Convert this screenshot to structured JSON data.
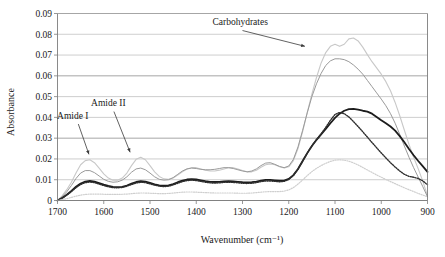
{
  "chart_data": {
    "type": "line",
    "title": "",
    "xlabel": "Wavenumber (cm⁻¹)",
    "ylabel": "Absorbance",
    "xlim": [
      1700,
      900
    ],
    "ylim": [
      0,
      0.09
    ],
    "x_reversed": true,
    "grid": true,
    "legend": "none",
    "xticks": [
      1700,
      1600,
      1500,
      1400,
      1300,
      1200,
      1100,
      1000,
      900
    ],
    "xtick_labels": [
      "1700",
      "1600",
      "1500",
      "1400",
      "1300",
      "1200",
      "1100",
      "1000",
      "900"
    ],
    "yticks": [
      0,
      0.01,
      0.02,
      0.03,
      0.04,
      0.05,
      0.06,
      0.07,
      0.08,
      0.09
    ],
    "ytick_labels": [
      "0",
      "0.01",
      "0.02",
      "0.03",
      "0.04",
      "0.05",
      "0.06",
      "0.07",
      "0.08",
      "0.09"
    ],
    "annotations": [
      {
        "text": "Amide I",
        "label_x": 1667,
        "label_y": 0.0392,
        "arrow_from_x": 1655,
        "arrow_from_y": 0.0368,
        "arrow_to_x": 1632,
        "arrow_to_y": 0.0222
      },
      {
        "text": "Amide II",
        "label_x": 1590,
        "label_y": 0.0455,
        "arrow_from_x": 1578,
        "arrow_from_y": 0.0428,
        "arrow_to_x": 1543,
        "arrow_to_y": 0.0232
      },
      {
        "text": "Carbohydrates",
        "label_x": 1305,
        "label_y": 0.0845,
        "arrow_from_x": 1300,
        "arrow_from_y": 0.0818,
        "arrow_to_x": 1165,
        "arrow_to_y": 0.0742
      }
    ],
    "x": [
      1700,
      1690,
      1680,
      1670,
      1660,
      1650,
      1640,
      1630,
      1620,
      1610,
      1600,
      1590,
      1580,
      1570,
      1560,
      1550,
      1540,
      1530,
      1520,
      1510,
      1500,
      1490,
      1480,
      1470,
      1460,
      1450,
      1440,
      1430,
      1420,
      1410,
      1400,
      1390,
      1380,
      1370,
      1360,
      1350,
      1340,
      1330,
      1320,
      1310,
      1300,
      1290,
      1280,
      1270,
      1260,
      1250,
      1240,
      1230,
      1220,
      1210,
      1200,
      1190,
      1180,
      1170,
      1160,
      1150,
      1140,
      1130,
      1120,
      1110,
      1100,
      1090,
      1080,
      1070,
      1060,
      1050,
      1040,
      1030,
      1020,
      1010,
      1000,
      990,
      980,
      970,
      960,
      950,
      940,
      930,
      920,
      910,
      900
    ],
    "series": [
      {
        "name": "spectrum-light-gray",
        "color": "#c8c8c8",
        "style": "solid",
        "width": 1.1,
        "values": [
          0.0,
          0.0022,
          0.0052,
          0.0088,
          0.0132,
          0.0172,
          0.0192,
          0.0196,
          0.0182,
          0.0156,
          0.0128,
          0.0108,
          0.0098,
          0.0098,
          0.0108,
          0.0132,
          0.0168,
          0.0198,
          0.0208,
          0.0196,
          0.0168,
          0.0138,
          0.0116,
          0.0104,
          0.0102,
          0.0108,
          0.0122,
          0.0138,
          0.0152,
          0.0158,
          0.0158,
          0.0152,
          0.0146,
          0.0142,
          0.0142,
          0.0146,
          0.0152,
          0.0158,
          0.0158,
          0.0152,
          0.0144,
          0.0138,
          0.0138,
          0.0146,
          0.016,
          0.0172,
          0.0176,
          0.0172,
          0.0162,
          0.0156,
          0.0162,
          0.0192,
          0.025,
          0.0332,
          0.0424,
          0.0512,
          0.0592,
          0.0662,
          0.0712,
          0.0742,
          0.0752,
          0.0742,
          0.0752,
          0.0778,
          0.0782,
          0.0768,
          0.0738,
          0.0702,
          0.0668,
          0.0638,
          0.0608,
          0.0572,
          0.0528,
          0.0472,
          0.0408,
          0.0338,
          0.027,
          0.0208,
          0.0152,
          0.0092,
          0.0022
        ]
      },
      {
        "name": "spectrum-medium-gray",
        "color": "#9a9a9a",
        "style": "solid",
        "width": 1.0,
        "values": [
          0.0,
          0.0018,
          0.0042,
          0.0072,
          0.0106,
          0.0132,
          0.0144,
          0.0144,
          0.0134,
          0.0118,
          0.0102,
          0.0092,
          0.0088,
          0.009,
          0.0098,
          0.0114,
          0.0136,
          0.0152,
          0.0156,
          0.0148,
          0.0132,
          0.0114,
          0.0102,
          0.0098,
          0.01,
          0.011,
          0.0126,
          0.0142,
          0.0152,
          0.0156,
          0.0154,
          0.015,
          0.0148,
          0.0148,
          0.015,
          0.0154,
          0.0158,
          0.0158,
          0.0154,
          0.0148,
          0.0142,
          0.0138,
          0.0142,
          0.0152,
          0.0168,
          0.018,
          0.0182,
          0.0174,
          0.0164,
          0.0158,
          0.0166,
          0.0198,
          0.0258,
          0.0338,
          0.0422,
          0.05,
          0.0562,
          0.0612,
          0.065,
          0.0672,
          0.0682,
          0.0682,
          0.0678,
          0.0668,
          0.0652,
          0.0632,
          0.0608,
          0.0578,
          0.0548,
          0.0518,
          0.0488,
          0.0456,
          0.0418,
          0.0372,
          0.0318,
          0.0262,
          0.0208,
          0.0158,
          0.0112,
          0.0066,
          0.0018
        ]
      },
      {
        "name": "spectrum-bold-black",
        "color": "#1c1c1c",
        "style": "solid",
        "width": 1.8,
        "values": [
          0.0,
          0.0012,
          0.0028,
          0.0046,
          0.0066,
          0.0082,
          0.0091,
          0.0094,
          0.0091,
          0.0084,
          0.0076,
          0.007,
          0.0066,
          0.0064,
          0.0066,
          0.0072,
          0.0081,
          0.0089,
          0.0093,
          0.0091,
          0.0085,
          0.0078,
          0.0073,
          0.0071,
          0.0073,
          0.0079,
          0.0088,
          0.0096,
          0.0101,
          0.0103,
          0.0101,
          0.0097,
          0.0093,
          0.009,
          0.0089,
          0.009,
          0.0092,
          0.0093,
          0.0092,
          0.009,
          0.0088,
          0.0087,
          0.0088,
          0.0091,
          0.0096,
          0.0099,
          0.0099,
          0.0097,
          0.0095,
          0.0096,
          0.0104,
          0.0122,
          0.0152,
          0.019,
          0.0228,
          0.0262,
          0.0292,
          0.0318,
          0.0344,
          0.0372,
          0.0398,
          0.0418,
          0.0432,
          0.044,
          0.0441,
          0.0437,
          0.0432,
          0.0428,
          0.0418,
          0.0402,
          0.0386,
          0.0372,
          0.0356,
          0.0336,
          0.031,
          0.028,
          0.0248,
          0.0218,
          0.019,
          0.0164,
          0.0138
        ]
      },
      {
        "name": "spectrum-dark-dotted",
        "color": "#2e2e2e",
        "style": "dotted",
        "width": 1.4,
        "values": [
          0.0,
          0.0011,
          0.0026,
          0.0043,
          0.0062,
          0.0077,
          0.0086,
          0.0089,
          0.0086,
          0.0079,
          0.0072,
          0.0066,
          0.0062,
          0.0061,
          0.0063,
          0.0069,
          0.0077,
          0.0084,
          0.0088,
          0.0086,
          0.008,
          0.0074,
          0.0069,
          0.0067,
          0.0069,
          0.0075,
          0.0083,
          0.0091,
          0.0096,
          0.0098,
          0.0096,
          0.0092,
          0.0088,
          0.0085,
          0.0084,
          0.0085,
          0.0087,
          0.0088,
          0.0087,
          0.0085,
          0.0083,
          0.0082,
          0.0083,
          0.0086,
          0.0091,
          0.0094,
          0.0094,
          0.0092,
          0.009,
          0.0092,
          0.0101,
          0.012,
          0.0151,
          0.0189,
          0.0228,
          0.0263,
          0.0293,
          0.0321,
          0.0352,
          0.0386,
          0.0414,
          0.0424,
          0.0418,
          0.0402,
          0.038,
          0.0356,
          0.0331,
          0.0305,
          0.0279,
          0.0254,
          0.0229,
          0.0205,
          0.0182,
          0.0161,
          0.0142,
          0.0126,
          0.0116,
          0.0112,
          0.0106,
          0.0094,
          0.0076
        ]
      },
      {
        "name": "spectrum-pale-dotted",
        "color": "#cfcfcf",
        "style": "dotted",
        "width": 1.2,
        "values": [
          0.0,
          0.0004,
          0.0009,
          0.0015,
          0.0021,
          0.0026,
          0.0029,
          0.0031,
          0.0031,
          0.0031,
          0.003,
          0.0029,
          0.0029,
          0.0029,
          0.003,
          0.0031,
          0.0033,
          0.0035,
          0.0036,
          0.0036,
          0.0035,
          0.0034,
          0.0033,
          0.0033,
          0.0034,
          0.0036,
          0.0038,
          0.004,
          0.0041,
          0.0041,
          0.004,
          0.0039,
          0.0038,
          0.0037,
          0.0036,
          0.0036,
          0.0036,
          0.0036,
          0.0036,
          0.0035,
          0.0035,
          0.0035,
          0.0036,
          0.0038,
          0.004,
          0.0042,
          0.0043,
          0.0043,
          0.0043,
          0.0045,
          0.0051,
          0.0062,
          0.0079,
          0.0099,
          0.012,
          0.0139,
          0.0155,
          0.0168,
          0.0179,
          0.0188,
          0.0194,
          0.0196,
          0.0194,
          0.0189,
          0.0181,
          0.0171,
          0.0159,
          0.0147,
          0.0135,
          0.0123,
          0.0112,
          0.0101,
          0.0091,
          0.0081,
          0.0071,
          0.0061,
          0.0052,
          0.0043,
          0.0034,
          0.0026,
          0.0018
        ]
      }
    ]
  }
}
